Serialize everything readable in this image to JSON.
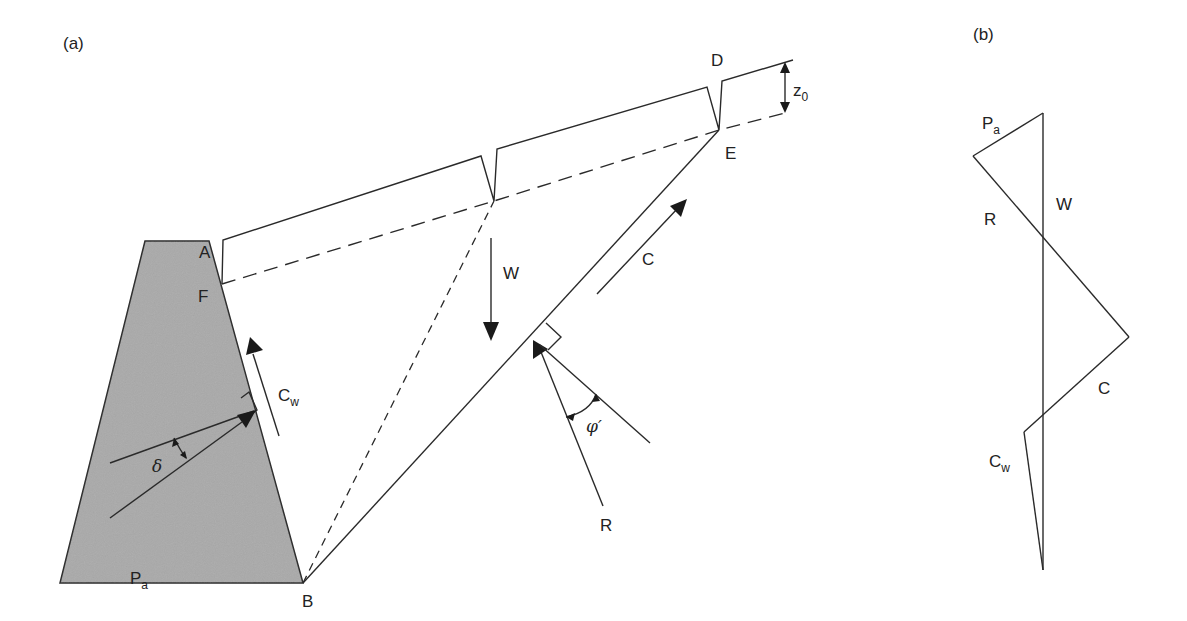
{
  "panels": {
    "a": {
      "label": "(a)",
      "points": {
        "A": "A",
        "B": "B",
        "D": "D",
        "E": "E",
        "F": "F"
      },
      "forces": {
        "W": "W",
        "C": "C",
        "R": "R",
        "Cw_main": "C",
        "Cw_sub": "w",
        "Pa_main": "P",
        "Pa_sub": "a"
      },
      "angles": {
        "delta": "δ",
        "phi": "φ′"
      },
      "dimension": {
        "z0_main": "z",
        "z0_sub": "0"
      },
      "colors": {
        "wall_fill": "#a9a9a9",
        "line": "#2a2a2a"
      }
    },
    "b": {
      "label": "(b)",
      "force_polygon": {
        "Pa_main": "P",
        "Pa_sub": "a",
        "W": "W",
        "R": "R",
        "C": "C",
        "Cw_main": "C",
        "Cw_sub": "w"
      }
    }
  }
}
